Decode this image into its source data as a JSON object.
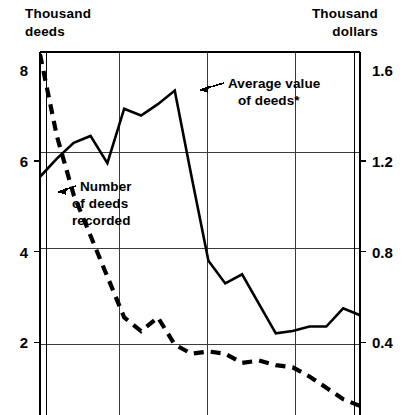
{
  "chart_data": {
    "type": "line",
    "title": "",
    "subtitle": "",
    "left_axis": {
      "label_line1": "Thousand",
      "label_line2": "deeds",
      "ticks": [
        "8",
        "6",
        "4",
        "2"
      ],
      "tick_values": [
        8,
        6,
        4,
        2
      ],
      "ylim": [
        0.4,
        8.4
      ]
    },
    "right_axis": {
      "label_line1": "Thousand",
      "label_line2": "dollars",
      "ticks": [
        "1.6",
        "1.2",
        "0.8",
        "0.4"
      ],
      "tick_values": [
        1.6,
        1.2,
        0.8,
        0.4
      ],
      "ylim": [
        0.08,
        1.68
      ]
    },
    "xlabel": "",
    "x_ticks": [],
    "grid": true,
    "legend_position": "inline-annotation",
    "series": [
      {
        "name": "Average value of deeds*",
        "style": "solid",
        "axis": "right",
        "annotation": {
          "line1": "Average value",
          "line2": "of deeds*",
          "arrow": "left"
        },
        "x": [
          0,
          1,
          2,
          3,
          4,
          5,
          6,
          7,
          8,
          9,
          10,
          11,
          12,
          13,
          14,
          15,
          16,
          17,
          18,
          19
        ],
        "values": [
          1.13,
          1.21,
          1.28,
          1.31,
          1.19,
          1.43,
          1.4,
          1.45,
          1.51,
          1.13,
          0.76,
          0.66,
          0.7,
          0.57,
          0.44,
          0.45,
          0.47,
          0.47,
          0.55,
          0.52
        ]
      },
      {
        "name": "Number of deeds recorded",
        "style": "dashed",
        "axis": "left",
        "annotation": {
          "line1": "Number",
          "line2": "of deeds",
          "line3": "recorded",
          "arrow": "left"
        },
        "x": [
          0,
          1,
          2,
          3,
          4,
          5,
          6,
          7,
          8,
          9,
          10,
          11,
          12,
          13,
          14,
          15,
          16,
          17,
          18,
          19
        ],
        "values": [
          8.35,
          6.55,
          5.25,
          4.35,
          3.45,
          2.55,
          2.25,
          2.55,
          1.95,
          1.75,
          1.8,
          1.75,
          1.55,
          1.6,
          1.5,
          1.45,
          1.25,
          1.0,
          0.75,
          0.6
        ]
      }
    ],
    "footnote_marker": "*"
  },
  "colors": {
    "ink": "#000000",
    "grid": "#3a3a3a",
    "background": "#ffffff"
  },
  "geometry": {
    "plot_left": 40,
    "plot_right": 360,
    "plot_top": 52,
    "plot_bottom": 415,
    "v_gridlines": [
      119,
      207,
      295
    ],
    "h_gridlines": [
      152,
      248,
      344
    ]
  }
}
